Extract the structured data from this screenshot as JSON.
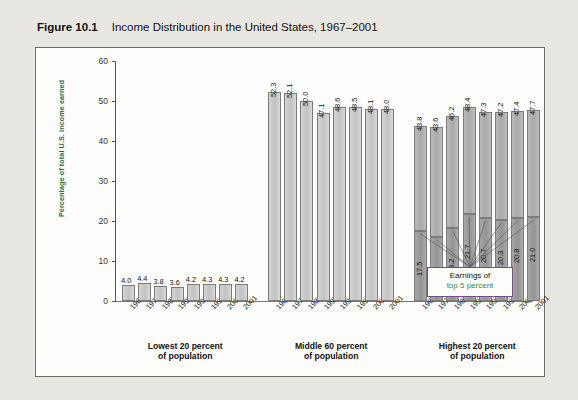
{
  "figure": {
    "number": "Figure 10.1",
    "title": "Income Distribution in the United States, 1967–2001"
  },
  "callout": {
    "line1": "Earnings of",
    "line2": "top 5 percent",
    "accent_color": "#2d8a4e",
    "border_color": "#7a4b8a"
  },
  "colors": {
    "page_background": "#cfcbc4",
    "card_background": "#e9e7e1",
    "panel_background": "#fdfdfb",
    "axis": "#555555",
    "bar_light": "#cccccc",
    "bar_dark": "#9b9b9b",
    "bar_top5": "#b2b2b2",
    "axis_title": "#2d6a40"
  },
  "chart_data": {
    "type": "bar",
    "title": "Income Distribution in the United States, 1967–2001",
    "xlabel": "",
    "ylabel": "Percentage of total U.S. income earned",
    "ylim": [
      0,
      60
    ],
    "yticks": [
      0,
      10,
      20,
      30,
      40,
      50,
      60
    ],
    "grid": false,
    "legend": "Earnings of top 5 percent",
    "categories": [
      "1967",
      "1977",
      "1987",
      "1997",
      "1998",
      "1999",
      "2000",
      "2001"
    ],
    "groups": [
      {
        "name": "Lowest 20 percent of population",
        "label_line1": "Lowest 20 percent",
        "label_line2": "of population",
        "values": [
          4.0,
          4.4,
          3.8,
          3.6,
          4.2,
          4.3,
          4.3,
          4.2
        ]
      },
      {
        "name": "Middle 60 percent of population",
        "label_line1": "Middle 60 percent",
        "label_line2": "of population",
        "values": [
          52.3,
          52.1,
          50.0,
          47.1,
          48.6,
          48.5,
          48.1,
          48.0
        ]
      },
      {
        "name": "Highest 20 percent of population",
        "label_line1": "Highest 20 percent",
        "label_line2": "of population",
        "values": [
          43.8,
          43.6,
          46.2,
          48.4,
          47.3,
          47.2,
          47.4,
          47.7
        ],
        "series": [
          {
            "name": "Top 5 percent",
            "values": [
              17.5,
              16.1,
              18.2,
              21.7,
              20.7,
              20.3,
              20.8,
              21.0
            ]
          }
        ]
      }
    ]
  }
}
